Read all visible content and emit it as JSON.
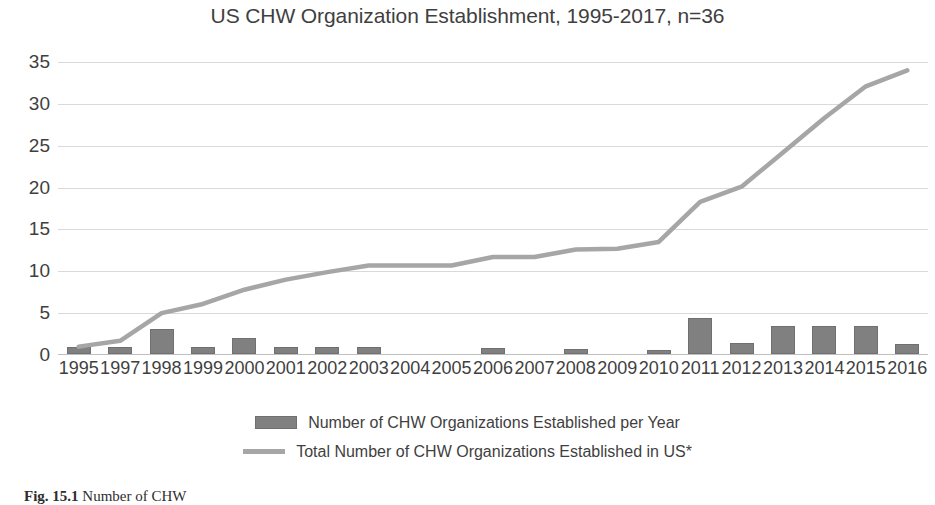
{
  "chart_data": {
    "type": "bar",
    "title": "US CHW Organization Establishment, 1995-2017, n=36",
    "xlabel": "",
    "ylabel": "",
    "ylim": [
      0,
      35
    ],
    "yticks": [
      0,
      5,
      10,
      15,
      20,
      25,
      30,
      35
    ],
    "ytick_labels": [
      "0",
      "5",
      "10",
      "15",
      "20",
      "25",
      "30",
      "35"
    ],
    "grid": true,
    "legend_position": "bottom",
    "categories": [
      "1995",
      "1997",
      "1998",
      "1999",
      "2000",
      "2001",
      "2002",
      "2003",
      "2004",
      "2005",
      "2006",
      "2007",
      "2008",
      "2009",
      "2010",
      "2011",
      "2012",
      "2013",
      "2014",
      "2015",
      "2016"
    ],
    "series": [
      {
        "name": "Number of CHW Organizations Established per Year",
        "type": "bar",
        "color": "#808080",
        "values": [
          0.8,
          0.8,
          3.0,
          0.8,
          1.9,
          0.8,
          0.8,
          0.8,
          0,
          0,
          0.7,
          0,
          0.6,
          0,
          0.5,
          4.3,
          1.3,
          3.4,
          3.3,
          3.3,
          1.2
        ]
      },
      {
        "name": "Total Number of CHW Organizations Established in US*",
        "type": "line",
        "color": "#a6a6a6",
        "values": [
          1.0,
          1.7,
          5.0,
          6.1,
          7.8,
          9.0,
          9.9,
          10.7,
          10.7,
          10.7,
          11.7,
          11.7,
          12.6,
          12.7,
          13.5,
          18.3,
          20.1,
          24.2,
          28.3,
          32.1,
          34.0
        ]
      }
    ]
  },
  "legend": {
    "items": [
      {
        "label": "Number of CHW Organizations Established per Year",
        "marker": "bar-swatch"
      },
      {
        "label": "Total Number of CHW Organizations Established in US*",
        "marker": "line-swatch"
      }
    ]
  },
  "caption": {
    "figure_number": "Fig. 15.1",
    "text": "Number of CHW"
  },
  "colors": {
    "bar": "#808080",
    "line": "#a6a6a6",
    "grid": "#d9d9d9",
    "text": "#3f3f3f"
  }
}
